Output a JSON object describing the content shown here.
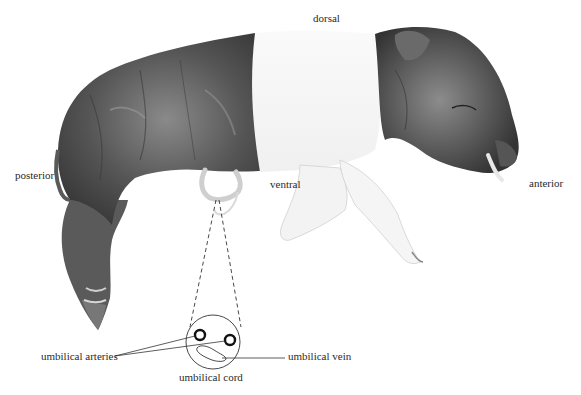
{
  "figure": {
    "colors": {
      "background": "#ffffff",
      "skin_dark": "#4a4a4a",
      "skin_mid": "#7a7a7a",
      "skin_light": "#f2f2f2",
      "line": "#333333",
      "label_text": "#2a2a2a"
    }
  },
  "orientation_labels": {
    "dorsal": "dorsal",
    "ventral": "ventral",
    "anterior": "anterior",
    "posterior": "posterior"
  },
  "inset": {
    "title": "umbilical cord",
    "arteries_label": "umbilical arteries",
    "vein_label": "umbilical vein"
  }
}
